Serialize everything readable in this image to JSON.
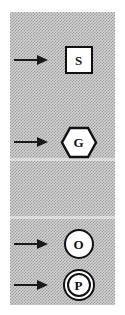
{
  "panel": {
    "background_color": "#d2d2d2",
    "dither_color": "#787878",
    "ink_color": "#111111",
    "fill_color": "#ffffff"
  },
  "legend": {
    "rows": [
      {
        "id": "state",
        "letter": "S",
        "shape": "square",
        "arrow": "right-arrow"
      },
      {
        "id": "gateway",
        "letter": "G",
        "shape": "hexagon",
        "arrow": "right-arrow"
      },
      {
        "id": "object",
        "letter": "O",
        "shape": "circle",
        "arrow": "right-arrow"
      },
      {
        "id": "process",
        "letter": "P",
        "shape": "double-circle",
        "arrow": "right-arrow"
      }
    ]
  }
}
